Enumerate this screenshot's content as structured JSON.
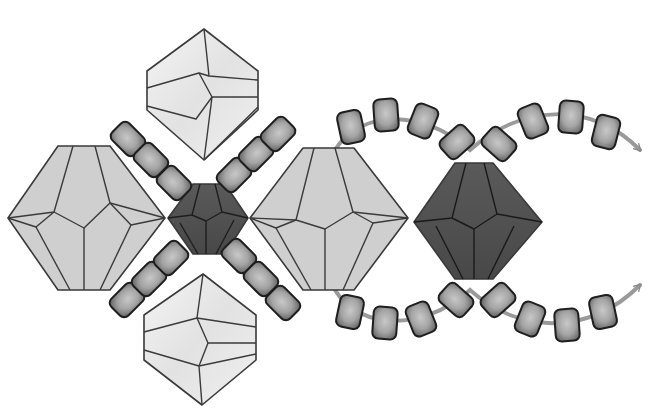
{
  "diagram": {
    "label": "Beading pattern diagram: bicone crystals joined by seed beads with thread path arrows",
    "colors": {
      "background": "#ffffff",
      "large_bicone_fill": "#cfcfcf",
      "pale_bicone_fill": "#ececec",
      "dark_bicone_fill": "#505050",
      "seed_bead_fill": "#9c9c9c",
      "seed_bead_highlight": "#c4c4c4",
      "outline": "#3a3a3a",
      "thread": "#9a9a9a"
    },
    "beads": {
      "large_bicones": [
        {
          "id": "large-bicone-left",
          "cx": 86,
          "cy": 218
        },
        {
          "id": "large-bicone-middle",
          "cx": 329,
          "cy": 218
        }
      ],
      "pale_bicones": [
        {
          "id": "pale-bicone-top",
          "cx": 203,
          "cy": 92
        },
        {
          "id": "pale-bicone-bottom",
          "cx": 201,
          "cy": 335
        }
      ],
      "dark_bicones": [
        {
          "id": "dark-bicone-small-center",
          "cx": 208,
          "cy": 219
        },
        {
          "id": "dark-bicone-large-right",
          "cx": 474,
          "cy": 219
        }
      ],
      "seed_bead_count_cross": 12,
      "seed_bead_count_top_arc": 8,
      "seed_bead_count_bottom_arc": 8
    },
    "thread_paths": [
      {
        "id": "top-thread",
        "direction": "arrow pointing right/down at end",
        "end": [
          645,
          155
        ]
      },
      {
        "id": "bottom-thread",
        "direction": "arrow pointing right/up at end",
        "end": [
          645,
          285
        ]
      }
    ]
  }
}
